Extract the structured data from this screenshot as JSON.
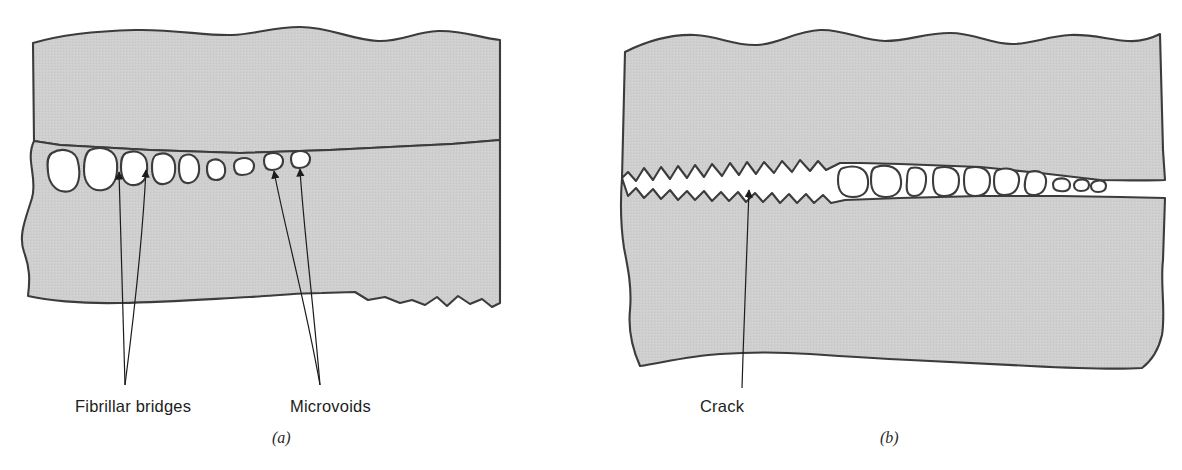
{
  "figure": {
    "background_color": "#ffffff",
    "material_fill_color": "#cdcdcd",
    "material_stroke_color": "#3c3c3c",
    "void_fill_color": "#ffffff",
    "label_color": "#1c1c1c",
    "caption_color": "#2a2a2a"
  },
  "panels": [
    {
      "id": "panel-a",
      "caption": "(a)",
      "caption_x": 272,
      "caption_y": 443,
      "description": "Craze zone containing aligned microvoids separated by fibrillar bridges",
      "labels": [
        {
          "name": "fibrillar-bridges",
          "text": "Fibrillar bridges",
          "x": 75,
          "y": 412,
          "arrows": 2,
          "arrow_origin_x": 125,
          "arrow_origin_y": 385,
          "arrow_targets": [
            {
              "x": 119,
              "y": 168
            },
            {
              "x": 146,
              "y": 166
            }
          ]
        },
        {
          "name": "microvoids",
          "text": "Microvoids",
          "x": 290,
          "y": 412,
          "arrows": 2,
          "arrow_origin_x": 320,
          "arrow_origin_y": 385,
          "arrow_targets": [
            {
              "x": 273,
              "y": 167
            },
            {
              "x": 300,
              "y": 165
            }
          ]
        }
      ],
      "voids": [
        {
          "cx": 63,
          "cy": 170,
          "rx": 15,
          "ry": 22
        },
        {
          "cx": 100,
          "cy": 168,
          "rx": 16,
          "ry": 21
        },
        {
          "cx": 134,
          "cy": 170,
          "rx": 12,
          "ry": 18
        },
        {
          "cx": 163,
          "cy": 170,
          "rx": 11,
          "ry": 16
        },
        {
          "cx": 189,
          "cy": 170,
          "rx": 9,
          "ry": 14
        },
        {
          "cx": 216,
          "cy": 169,
          "rx": 8,
          "ry": 10
        },
        {
          "cx": 245,
          "cy": 166,
          "rx": 9,
          "ry": 8
        },
        {
          "cx": 274,
          "cy": 161,
          "rx": 9,
          "ry": 7
        },
        {
          "cx": 301,
          "cy": 159,
          "rx": 9,
          "ry": 7
        }
      ]
    },
    {
      "id": "panel-b",
      "caption": "(b)",
      "caption_x": 880,
      "caption_y": 443,
      "description": "Crack has formed by coalescence of microvoids; fibrillar bridges broken near the crack mouth",
      "labels": [
        {
          "name": "crack",
          "text": "Crack",
          "x": 700,
          "y": 412,
          "arrows": 1,
          "arrow_origin_x": 742,
          "arrow_origin_y": 388,
          "arrow_targets": [
            {
              "x": 749,
              "y": 184
            }
          ]
        }
      ],
      "voids": [
        {
          "cx": 853,
          "cy": 181,
          "rx": 13,
          "ry": 16
        },
        {
          "cx": 886,
          "cy": 181,
          "rx": 13,
          "ry": 16
        },
        {
          "cx": 917,
          "cy": 182,
          "rx": 9,
          "ry": 14
        },
        {
          "cx": 946,
          "cy": 181,
          "rx": 12,
          "ry": 14
        },
        {
          "cx": 977,
          "cy": 181,
          "rx": 12,
          "ry": 14
        },
        {
          "cx": 1007,
          "cy": 182,
          "rx": 12,
          "ry": 13
        },
        {
          "cx": 1036,
          "cy": 183,
          "rx": 11,
          "ry": 12
        },
        {
          "cx": 1062,
          "cy": 184,
          "rx": 8,
          "ry": 6
        },
        {
          "cx": 1082,
          "cy": 184,
          "rx": 6,
          "ry": 5
        },
        {
          "cx": 1099,
          "cy": 185,
          "rx": 5,
          "ry": 5
        }
      ]
    }
  ]
}
